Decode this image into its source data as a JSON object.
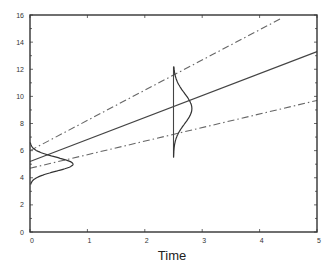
{
  "chart_data": {
    "type": "line",
    "title": "",
    "xlabel": "Time",
    "ylabel": "",
    "xlim": [
      0,
      5
    ],
    "ylim": [
      0,
      16
    ],
    "x_ticks": [
      "0",
      "1",
      "2",
      "3",
      "4",
      "5"
    ],
    "y_ticks": [
      "0",
      "2",
      "4",
      "6",
      "8",
      "10",
      "12",
      "14",
      "16"
    ],
    "grid": false,
    "legend": null,
    "series": [
      {
        "name": "mean trajectory",
        "style": "solid",
        "x": [
          0,
          5
        ],
        "y": [
          5.2,
          13.3
        ]
      },
      {
        "name": "upper bound",
        "style": "dash-dot",
        "x": [
          0,
          4.4
        ],
        "y": [
          6.0,
          15.8
        ]
      },
      {
        "name": "lower bound",
        "style": "dash-dot",
        "x": [
          0,
          5
        ],
        "y": [
          4.7,
          9.7
        ]
      }
    ],
    "distributions": [
      {
        "name": "initial distribution",
        "at_x": 0,
        "peak_y": 5.0,
        "peak_height": 0.75,
        "y_range": [
          3.5,
          6.6
        ]
      },
      {
        "name": "distribution at t=2.5",
        "at_x": 2.5,
        "peak_y": 9.1,
        "peak_height": 0.32,
        "y_range": [
          5.5,
          12.2
        ]
      }
    ],
    "annotations": [
      {
        "type": "vertical-line",
        "x": 2.5,
        "y_from": 5.5,
        "y_to": 12.2
      }
    ]
  },
  "labels": {
    "x_axis_title": "Time"
  }
}
